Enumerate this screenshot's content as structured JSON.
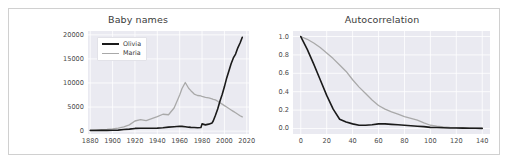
{
  "figure": {
    "panels": [
      "Baby names",
      "Autocorrelation"
    ]
  },
  "colors": {
    "olivia": "#1a1a1a",
    "maria": "#a9a9a9",
    "plot_background": "#eaeaf1",
    "grid": "#ffffff",
    "tick_label": "#4a4a4a",
    "title": "#3b3b3b",
    "frame_border": "#d0d0d0"
  },
  "chart_data": [
    {
      "type": "line",
      "title": "Baby names",
      "xlabel": "",
      "ylabel": "",
      "xlim": [
        1878,
        2022
      ],
      "ylim": [
        -600,
        20800
      ],
      "grid": true,
      "legend_position": "upper left",
      "xticks": [
        1880,
        1900,
        1920,
        1940,
        1960,
        1980,
        2000,
        2020
      ],
      "yticks": [
        0,
        5000,
        10000,
        15000,
        20000
      ],
      "x": [
        1880,
        1885,
        1890,
        1895,
        1900,
        1905,
        1910,
        1915,
        1920,
        1925,
        1930,
        1935,
        1940,
        1945,
        1950,
        1955,
        1960,
        1962,
        1965,
        1968,
        1970,
        1973,
        1976,
        1979,
        1980,
        1983,
        1986,
        1989,
        1990,
        1992,
        1994,
        1996,
        1998,
        2000,
        2002,
        2004,
        2006,
        2008,
        2010,
        2012,
        2014,
        2016
      ],
      "series": [
        {
          "name": "Olivia",
          "color": "#1a1a1a",
          "values": [
            120,
            135,
            150,
            160,
            175,
            210,
            330,
            420,
            560,
            590,
            600,
            590,
            620,
            700,
            820,
            900,
            1000,
            980,
            900,
            820,
            780,
            740,
            700,
            760,
            1500,
            1300,
            1450,
            1700,
            2100,
            3300,
            4600,
            6200,
            7600,
            9200,
            11000,
            12500,
            14000,
            15200,
            16000,
            17300,
            18300,
            19500
          ]
        },
        {
          "name": "Maria",
          "color": "#a9a9a9",
          "values": [
            250,
            280,
            320,
            380,
            470,
            620,
            900,
            1300,
            2100,
            2400,
            2200,
            2600,
            3000,
            3500,
            3400,
            4800,
            7500,
            8800,
            10100,
            8900,
            8400,
            7700,
            7400,
            7300,
            7200,
            7000,
            6900,
            6700,
            6600,
            6500,
            6200,
            5900,
            5600,
            5300,
            5000,
            4700,
            4400,
            4100,
            3800,
            3500,
            3200,
            2950
          ]
        }
      ]
    },
    {
      "type": "line",
      "title": "Autocorrelation",
      "xlabel": "",
      "ylabel": "",
      "xlim": [
        -6,
        146
      ],
      "ylim": [
        -0.06,
        1.06
      ],
      "grid": true,
      "legend_position": "upper right",
      "xticks": [
        0,
        20,
        40,
        60,
        80,
        100,
        120,
        140
      ],
      "yticks": [
        "0.0",
        "0.2",
        "0.4",
        "0.6",
        "0.8",
        "1.0"
      ],
      "x": [
        0,
        5,
        10,
        15,
        20,
        25,
        30,
        35,
        40,
        45,
        50,
        55,
        60,
        65,
        70,
        75,
        80,
        85,
        90,
        95,
        100,
        105,
        110,
        115,
        120,
        125,
        130,
        135,
        140
      ],
      "series": [
        {
          "name": "Olivia",
          "color": "#1a1a1a",
          "values": [
            1.0,
            0.86,
            0.7,
            0.53,
            0.36,
            0.21,
            0.1,
            0.07,
            0.05,
            0.035,
            0.035,
            0.04,
            0.05,
            0.05,
            0.045,
            0.04,
            0.035,
            0.03,
            0.025,
            0.02,
            0.012,
            0.01,
            0.008,
            0.006,
            0.005,
            0.004,
            0.003,
            0.002,
            0.001
          ]
        },
        {
          "name": "Maria",
          "color": "#a9a9a9",
          "values": [
            1.0,
            0.97,
            0.93,
            0.88,
            0.82,
            0.76,
            0.69,
            0.62,
            0.53,
            0.45,
            0.38,
            0.31,
            0.25,
            0.21,
            0.18,
            0.155,
            0.13,
            0.11,
            0.09,
            0.06,
            0.035,
            0.025,
            0.018,
            0.013,
            0.01,
            0.008,
            0.006,
            0.004,
            0.002
          ]
        }
      ]
    }
  ]
}
